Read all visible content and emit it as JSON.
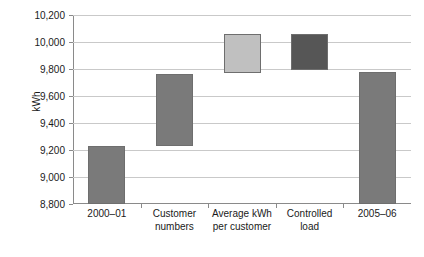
{
  "chart_data": {
    "type": "bar",
    "subtype": "waterfall",
    "title": "",
    "xlabel": "",
    "ylabel": "kWh",
    "ylim": [
      8800,
      10200
    ],
    "ytick_step": 200,
    "ytick_labels": [
      "10,200",
      "10,000",
      "9,800",
      "9,600",
      "9,400",
      "9,200",
      "9,000",
      "8,800"
    ],
    "ytick_values": [
      10200,
      10000,
      9800,
      9600,
      9400,
      9200,
      9000,
      8800
    ],
    "grid": true,
    "legend": "none",
    "categories": [
      "2000–01",
      "Customer numbers",
      "Average kWh per customer",
      "Controlled load",
      "2005–06"
    ],
    "category_lines": [
      [
        "2000–01"
      ],
      [
        "Customer",
        "numbers"
      ],
      [
        "Average kWh",
        "per customer"
      ],
      [
        "Controlled",
        "load"
      ],
      [
        "2005–06"
      ]
    ],
    "bars": [
      {
        "category": "2000–01",
        "base": 8800,
        "top": 9230,
        "value": 9230,
        "kind": "total",
        "color": "#7a7a7a"
      },
      {
        "category": "Customer numbers",
        "base": 9230,
        "top": 9760,
        "value": 530,
        "kind": "increase",
        "color": "#7a7a7a"
      },
      {
        "category": "Average kWh per customer",
        "base": 9770,
        "top": 10060,
        "value": 290,
        "kind": "increase",
        "color": "#c0c0c0"
      },
      {
        "category": "Controlled load",
        "base": 9790,
        "top": 10060,
        "value": 270,
        "kind": "decrease",
        "color": "#565656"
      },
      {
        "category": "2005–06",
        "base": 8800,
        "top": 9780,
        "value": 9780,
        "kind": "total",
        "color": "#7a7a7a"
      }
    ],
    "colors": {
      "bar_medium": "#7a7a7a",
      "bar_light": "#c0c0c0",
      "bar_dark": "#565656",
      "bar_outline": "#6e6e6e",
      "gridline": "#c9c9c9",
      "axis": "#8a8a8a",
      "text": "#1a1a1a",
      "background": "#ffffff"
    }
  }
}
